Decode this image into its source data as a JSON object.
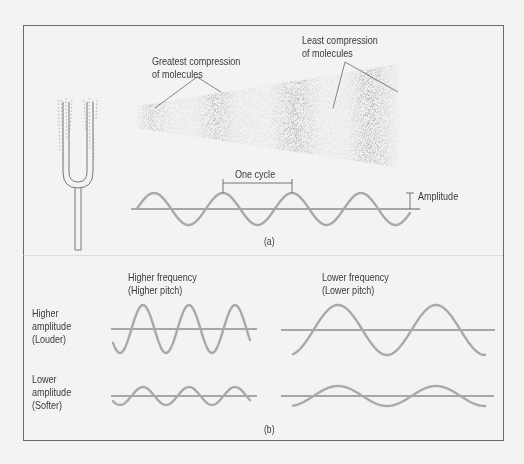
{
  "figure": {
    "background": "#f3f3f1",
    "frame_color": "#6a6a6a",
    "wave_color": "#a9a9a9",
    "axis_color": "#4a4a4a",
    "text_color": "#3a3a3a",
    "panel_a": {
      "caption": "(a)",
      "greatest_compression_label": [
        "Greatest compression",
        "of molecules"
      ],
      "least_compression_label": [
        "Least compression",
        "of molecules"
      ],
      "one_cycle_label": "One cycle",
      "amplitude_label": "Amplitude",
      "illustration": "tuning-fork"
    },
    "panel_b": {
      "caption": "(b)",
      "column_headers": [
        [
          "Higher frequency",
          "(Higher pitch)"
        ],
        [
          "Lower frequency",
          "(Lower pitch)"
        ]
      ],
      "row_headers": [
        [
          "Higher",
          "amplitude",
          "(Louder)"
        ],
        [
          "Lower",
          "amplitude",
          "(Softer)"
        ]
      ],
      "waves": [
        {
          "row": "higher amplitude",
          "col": "higher frequency",
          "cycles": 3,
          "amplitude": "large"
        },
        {
          "row": "higher amplitude",
          "col": "lower frequency",
          "cycles": 2,
          "amplitude": "large"
        },
        {
          "row": "lower amplitude",
          "col": "higher frequency",
          "cycles": 3,
          "amplitude": "small"
        },
        {
          "row": "lower amplitude",
          "col": "lower frequency",
          "cycles": 2,
          "amplitude": "small"
        }
      ]
    }
  }
}
